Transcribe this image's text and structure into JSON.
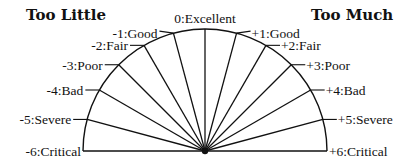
{
  "diagram": {
    "title_left": "Too Little",
    "title_right": "Too Much",
    "geometry": {
      "cx": 205,
      "cy": 151,
      "r": 122
    },
    "colors": {
      "line": "#111111",
      "background": "#ffffff"
    },
    "scale": [
      {
        "value": -6,
        "label": "-6:Critical"
      },
      {
        "value": -5,
        "label": "-5:Severe"
      },
      {
        "value": -4,
        "label": "-4:Bad"
      },
      {
        "value": -3,
        "label": "-3:Poor"
      },
      {
        "value": -2,
        "label": "-2:Fair"
      },
      {
        "value": -1,
        "label": "-1:Good"
      },
      {
        "value": 0,
        "label": "0:Excellent"
      },
      {
        "value": 1,
        "label": "+1:Good"
      },
      {
        "value": 2,
        "label": "+2:Fair"
      },
      {
        "value": 3,
        "label": "+3:Poor"
      },
      {
        "value": 4,
        "label": "+4:Bad"
      },
      {
        "value": 5,
        "label": "+5:Severe"
      },
      {
        "value": 6,
        "label": "+6:Critical"
      }
    ]
  }
}
